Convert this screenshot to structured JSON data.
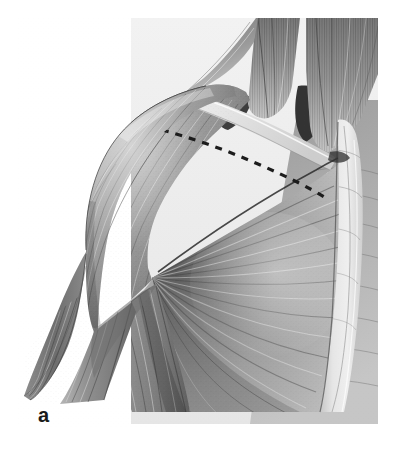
{
  "figure": {
    "panel_label": "a",
    "kind": "anatomical-illustration",
    "medium": "grayscale pencil / graphite rendering",
    "background_color": "#ffffff",
    "ink_color": "#1a1a1a",
    "panel": {
      "left": 131,
      "top": 18,
      "right": 378,
      "bottom": 424,
      "fill_color": "#efefef"
    }
  },
  "structures": [
    {
      "id": "deltoid",
      "label": "Deltoid",
      "tone": "#8a8a8a",
      "fiber_direction": "radiating inferolaterally toward deltoid tuberosity"
    },
    {
      "id": "pectoralis-major",
      "label": "Pectoralis major",
      "tone": "#9a9a9a",
      "fiber_direction": "fanning from sternum and clavicle to humeral convergence"
    },
    {
      "id": "sternocleidomastoid",
      "label": "Sternocleidomastoid",
      "tone": "#7c7c7c",
      "fiber_direction": "vertical, converging at sternal head"
    },
    {
      "id": "trapezius",
      "label": "Trapezius",
      "tone": "#848484",
      "fiber_direction": "descending toward clavicle"
    },
    {
      "id": "clavicle",
      "label": "Clavicle",
      "tone": "#e4e4e4",
      "fiber_direction": "transverse bony ridge"
    },
    {
      "id": "sternum",
      "label": "Sternum",
      "tone": "#e8e8e8",
      "fiber_direction": "vertical midline band"
    },
    {
      "id": "biceps-brachii",
      "label": "Biceps brachii",
      "tone": "#909090",
      "fiber_direction": "longitudinal down the arm"
    },
    {
      "id": "triceps-brachii",
      "label": "Triceps brachii",
      "tone": "#7a7a7a",
      "fiber_direction": "longitudinal down the posterior arm"
    },
    {
      "id": "supraclavicular-fossa",
      "label": "Supraclavicular fossa",
      "tone": "#3b3b3b",
      "fiber_direction": "shadowed recess"
    },
    {
      "id": "cut-line",
      "label": "Dashed resection line along clavicle",
      "tone": "#202020",
      "fiber_direction": "dashed curve from acromion to sternoclavicular joint"
    }
  ]
}
